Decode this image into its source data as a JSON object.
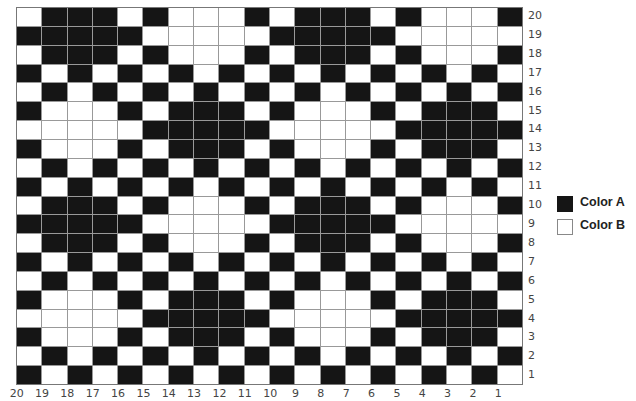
{
  "title": "",
  "legend": [
    {
      "label": "Color A",
      "color": "#151515"
    },
    {
      "label": "Color B",
      "color": "#ffffff"
    }
  ],
  "row_labels": [
    "20",
    "19",
    "18",
    "17",
    "16",
    "15",
    "14",
    "13",
    "12",
    "11",
    "10",
    "9",
    "8",
    "7",
    "6",
    "5",
    "4",
    "3",
    "2",
    "1"
  ],
  "col_labels": [
    "20",
    "19",
    "18",
    "17",
    "16",
    "15",
    "14",
    "13",
    "12",
    "11",
    "10",
    "9",
    "8",
    "7",
    "6",
    "5",
    "4",
    "3",
    "2",
    "1"
  ],
  "grid_note": "Rows listed top (row 20) to bottom (row 1); columns left (col 20) to right (col 1). 1 = Color A, 0 = Color B.",
  "grid": [
    [
      0,
      1,
      1,
      1,
      0,
      1,
      0,
      0,
      0,
      1,
      0,
      1,
      1,
      1,
      0,
      1,
      0,
      0,
      0,
      1
    ],
    [
      1,
      1,
      1,
      1,
      1,
      0,
      0,
      0,
      0,
      0,
      1,
      1,
      1,
      1,
      1,
      0,
      0,
      0,
      0,
      0
    ],
    [
      0,
      1,
      1,
      1,
      0,
      1,
      0,
      0,
      0,
      1,
      0,
      1,
      1,
      1,
      0,
      1,
      0,
      0,
      0,
      1
    ],
    [
      1,
      0,
      1,
      0,
      1,
      0,
      1,
      0,
      1,
      0,
      1,
      0,
      1,
      0,
      1,
      0,
      1,
      0,
      1,
      0
    ],
    [
      0,
      1,
      0,
      1,
      0,
      1,
      0,
      1,
      0,
      1,
      0,
      1,
      0,
      1,
      0,
      1,
      0,
      1,
      0,
      1
    ],
    [
      1,
      0,
      0,
      0,
      1,
      0,
      1,
      1,
      1,
      0,
      1,
      0,
      0,
      0,
      1,
      0,
      1,
      1,
      1,
      0
    ],
    [
      0,
      0,
      0,
      0,
      0,
      1,
      1,
      1,
      1,
      1,
      0,
      0,
      0,
      0,
      0,
      1,
      1,
      1,
      1,
      1
    ],
    [
      1,
      0,
      0,
      0,
      1,
      0,
      1,
      1,
      1,
      0,
      1,
      0,
      0,
      0,
      1,
      0,
      1,
      1,
      1,
      0
    ],
    [
      0,
      1,
      0,
      1,
      0,
      1,
      0,
      1,
      0,
      1,
      0,
      1,
      0,
      1,
      0,
      1,
      0,
      1,
      0,
      1
    ],
    [
      1,
      0,
      1,
      0,
      1,
      0,
      1,
      0,
      1,
      0,
      1,
      0,
      1,
      0,
      1,
      0,
      1,
      0,
      1,
      0
    ],
    [
      0,
      1,
      1,
      1,
      0,
      1,
      0,
      0,
      0,
      1,
      0,
      1,
      1,
      1,
      0,
      1,
      0,
      0,
      0,
      1
    ],
    [
      1,
      1,
      1,
      1,
      1,
      0,
      0,
      0,
      0,
      0,
      1,
      1,
      1,
      1,
      1,
      0,
      0,
      0,
      0,
      0
    ],
    [
      0,
      1,
      1,
      1,
      0,
      1,
      0,
      0,
      0,
      1,
      0,
      1,
      1,
      1,
      0,
      1,
      0,
      0,
      0,
      1
    ],
    [
      1,
      0,
      1,
      0,
      1,
      0,
      1,
      0,
      1,
      0,
      1,
      0,
      1,
      0,
      1,
      0,
      1,
      0,
      1,
      0
    ],
    [
      0,
      1,
      0,
      1,
      0,
      1,
      0,
      1,
      0,
      1,
      0,
      1,
      0,
      1,
      0,
      1,
      0,
      1,
      0,
      1
    ],
    [
      1,
      0,
      0,
      0,
      1,
      0,
      1,
      1,
      1,
      0,
      1,
      0,
      0,
      0,
      1,
      0,
      1,
      1,
      1,
      0
    ],
    [
      0,
      0,
      0,
      0,
      0,
      1,
      1,
      1,
      1,
      1,
      0,
      0,
      0,
      0,
      0,
      1,
      1,
      1,
      1,
      1
    ],
    [
      1,
      0,
      0,
      0,
      1,
      0,
      1,
      1,
      1,
      0,
      1,
      0,
      0,
      0,
      1,
      0,
      1,
      1,
      1,
      0
    ],
    [
      0,
      1,
      0,
      1,
      0,
      1,
      0,
      1,
      0,
      1,
      0,
      1,
      0,
      1,
      0,
      1,
      0,
      1,
      0,
      1
    ],
    [
      1,
      0,
      1,
      0,
      1,
      0,
      1,
      0,
      1,
      0,
      1,
      0,
      1,
      0,
      1,
      0,
      1,
      0,
      1,
      0
    ]
  ]
}
